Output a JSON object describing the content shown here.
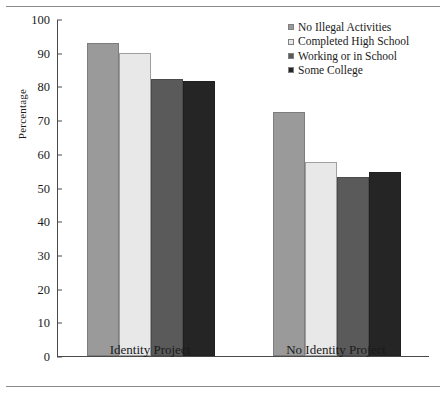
{
  "chart_data": {
    "type": "bar",
    "title": "",
    "xlabel": "",
    "ylabel": "Percentage",
    "ylim": [
      0,
      100
    ],
    "yticks": [
      0,
      10,
      20,
      30,
      40,
      50,
      60,
      70,
      80,
      90,
      100
    ],
    "grid": false,
    "legend_position": "top-right",
    "categories": [
      "Identity Project",
      "No Identity Project"
    ],
    "series": [
      {
        "name": "No Illegal Activities",
        "color": "#9a9a9a",
        "values": [
          92.8,
          72.5
        ]
      },
      {
        "name": "Completed High School",
        "color": "#e8e8e8",
        "values": [
          89.8,
          57.5
        ]
      },
      {
        "name": "Working or in School",
        "color": "#5a5a5a",
        "values": [
          82.3,
          53.0
        ]
      },
      {
        "name": "Some College",
        "color": "#252525",
        "values": [
          81.6,
          54.5
        ]
      }
    ]
  }
}
